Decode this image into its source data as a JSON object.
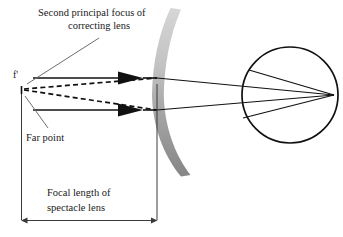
{
  "diagram": {
    "title_label": "Second principal focus of",
    "title_label_line2": "correcting lens",
    "focus_point_label": "f'",
    "far_point_label": "Far point",
    "dimension_label_line1": "Focal length of",
    "dimension_label_line2": "spectacle lens",
    "colors": {
      "ray": "#111111",
      "leader": "#6e6e6e",
      "dimension": "#3a3a3a",
      "lens_top": "#c9c9c9",
      "lens_bottom": "#8d8d8d",
      "background": "#ffffff"
    },
    "elements": {
      "focus_point": "second-principal-focus",
      "far_point": "far-point-marker",
      "spectacle_lens": "concave-meniscus-lens",
      "eye": "eyeball-circle",
      "incoming_rays": "parallel-incident-rays",
      "diverging_rays": "virtual-diverging-rays",
      "dimension": "focal-length-dimension"
    },
    "geometry": {
      "focus_x": 23,
      "focus_y": 84,
      "far_point_x": 23,
      "far_point_y": 89,
      "lens_plane_x": 157,
      "eye_center_x": 290,
      "eye_center_y": 95,
      "eye_radius": 48,
      "retina_x": 334,
      "ray_top_y": 78,
      "ray_bottom_y": 110,
      "dimension_y": 220
    }
  }
}
